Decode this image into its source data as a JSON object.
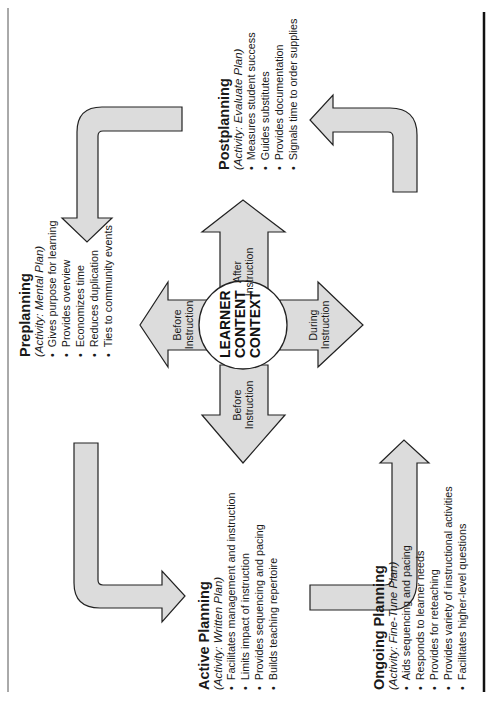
{
  "diagram": {
    "center": {
      "lines": [
        "LEARNER",
        "CONTENT",
        "CONTEXT"
      ]
    },
    "center_arrows": {
      "up": {
        "line1": "After",
        "line2": "Instruction"
      },
      "left_upper": {
        "line1": "Before",
        "line2": "Instruction"
      },
      "right": {
        "line1": "During",
        "line2": "Instruction"
      },
      "down": {
        "line1": "Before",
        "line2": "Instruction"
      }
    },
    "phases": {
      "preplanning": {
        "title": "Preplanning",
        "activity": "(Activity: Mental Plan)",
        "items": [
          "Gives purpose for learning",
          "Provides overview",
          "Economizes time",
          "Reduces duplication",
          "Ties to community events"
        ]
      },
      "postplanning": {
        "title": "Postplanning",
        "activity": "(Activity: Evaluate Plan)",
        "items": [
          "Measures student success",
          "Guides substitutes",
          "Provides documentation",
          "Signals time to order supplies"
        ]
      },
      "active_planning": {
        "title": "Active Planning",
        "activity": "(Activity: Written Plan)",
        "items": [
          "Facilitates management and instruction",
          "Limits impact of instruction",
          "Provides sequencing and pacing",
          "Builds teaching repertoire"
        ]
      },
      "ongoing_planning": {
        "title": "Ongoing Planning",
        "activity": "(Activity: Fine-Tune Plan)",
        "items": [
          "Aids sequencing and pacing",
          "Responds to learner needs",
          "Provides for reteaching",
          "Provides variety of instructional activities",
          "Facilitates higher-level questions"
        ]
      }
    },
    "bullet": "•",
    "colors": {
      "arrow_fill": "#dcdcdc",
      "stroke": "#222222",
      "text": "#1a1a1a"
    }
  }
}
